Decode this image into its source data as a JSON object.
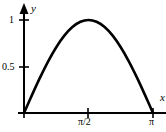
{
  "figure": {
    "width": 166,
    "height": 132,
    "background_color": "#ffffff",
    "ink_color": "#000000"
  },
  "axes": {
    "y_axis_label": "y",
    "x_axis_label": "x",
    "origin_px": [
      24,
      113
    ],
    "y_tick_labels": [
      "1",
      "0.5"
    ],
    "x_tick_labels": [
      "π/2",
      "π"
    ]
  },
  "chart_data": {
    "type": "line",
    "title": "",
    "xlabel": "x",
    "ylabel": "y",
    "xlim": [
      0,
      3.14159
    ],
    "ylim": [
      0,
      1.05
    ],
    "grid": false,
    "legend": null,
    "x_ticks": [
      1.5708,
      3.14159
    ],
    "x_tick_labels": [
      "π/2",
      "π"
    ],
    "y_ticks": [
      0.5,
      1
    ],
    "y_tick_labels": [
      "0.5",
      "1"
    ],
    "series": [
      {
        "name": "sin(x)",
        "color": "#000000",
        "line_width": 2.6,
        "x": [
          0,
          0.19635,
          0.3927,
          0.58905,
          0.7854,
          0.98175,
          1.1781,
          1.37445,
          1.5708,
          1.76715,
          1.9635,
          2.15985,
          2.35619,
          2.55254,
          2.74889,
          2.94524,
          3.14159
        ],
        "y": [
          0,
          0.19509,
          0.38268,
          0.55557,
          0.70711,
          0.83147,
          0.92388,
          0.98079,
          1.0,
          0.98079,
          0.92388,
          0.83147,
          0.70711,
          0.55557,
          0.38268,
          0.19509,
          0
        ]
      }
    ],
    "annotations": []
  }
}
